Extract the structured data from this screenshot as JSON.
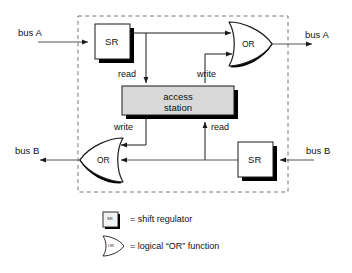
{
  "figure": {
    "colors": {
      "line": "#1a1a1a",
      "shadow": "#000000",
      "station_fill": "#d8d8d8",
      "dashed_border": "#777777",
      "text": "#111111",
      "background": "#ffffff"
    }
  },
  "boundary": {
    "name": "dashed enclosure"
  },
  "blocks": {
    "sr_top": {
      "label": "SR",
      "name": "shift-regulator-top"
    },
    "sr_bottom": {
      "label": "SR",
      "name": "shift-regulator-bottom"
    },
    "or_top": {
      "label": "OR",
      "name": "or-gate-top"
    },
    "or_bottom": {
      "label": "OR",
      "name": "or-gate-bottom"
    },
    "station": {
      "line1": "access",
      "line2": "station"
    }
  },
  "ports": {
    "bus_a_in": "bus A",
    "bus_a_out": "bus A",
    "bus_b_in": "bus B",
    "bus_b_out": "bus B"
  },
  "signals": {
    "read_top": "read",
    "write_top": "write",
    "write_bottom": "write",
    "read_bottom": "read"
  },
  "legend": {
    "items": [
      {
        "symbol": "SR",
        "text": "= shift regulator"
      },
      {
        "symbol": "OR",
        "text": "= logical “OR” function"
      }
    ]
  }
}
